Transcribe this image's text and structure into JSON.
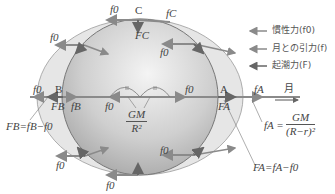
{
  "diagram": {
    "type": "tidal-force-diagram",
    "colors": {
      "earth_fill": "#c4c4c4",
      "tidal_bulge_fill": "#e3e3e3",
      "arrow": "#8a8a8a",
      "text": "#444444"
    },
    "points": {
      "A": "A",
      "B": "B",
      "C": "C"
    },
    "labels": {
      "f0": "f0",
      "fA": "fA",
      "fB": "fB",
      "fC": "fC",
      "FA": "FA",
      "FB": "FB",
      "FC": "FC",
      "moon": "月",
      "gm_num": "GM",
      "gm_den": "R²",
      "fA_eq_lhs": "fA =",
      "fA_eq_num": "GM",
      "fA_eq_den": "(R−r)²",
      "FB_eq": "FB=fB−f0",
      "FA_eq": "FA=fA−f0"
    },
    "legend": [
      {
        "icon": "arrow-left-icon",
        "label": "慣性力(f0)"
      },
      {
        "icon": "arrow-left-icon",
        "label": "月との引力(f)"
      },
      {
        "icon": "arrow-left-icon",
        "label": "起潮力(F)"
      }
    ]
  }
}
